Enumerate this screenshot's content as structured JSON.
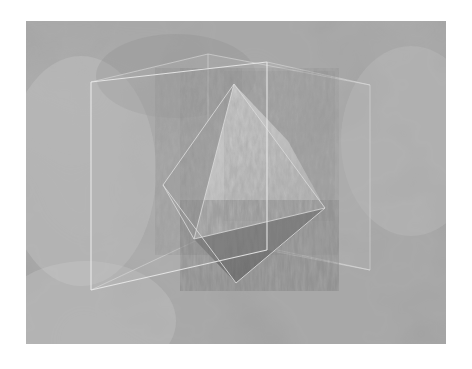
{
  "page": {
    "width": 472,
    "height": 369,
    "background_color": "#ffffff"
  },
  "figure": {
    "name": "octahedron-in-cube-render",
    "caption": "",
    "x": 26,
    "y": 21,
    "width": 420,
    "height": 323,
    "background": {
      "type": "procedural-cloud-marble",
      "base_color": "#a9a9a9",
      "light_color": "#c9c9c9",
      "dark_color": "#8b8b8b",
      "description": "soft blurred cloudy grayscale noise"
    },
    "scene": {
      "cube": {
        "name": "wireframe-cube",
        "style": "translucent faces with thin light edges",
        "edge_color": "#e8e8e8",
        "edge_opacity": 0.85,
        "face_fill": "#b4b4b4",
        "face_opacity": 0.18,
        "vertices_2d": {
          "front_top_left": [
            65,
            61
          ],
          "front_top_right": [
            241,
            41
          ],
          "front_bottom_right": [
            241,
            229
          ],
          "front_bottom_left": [
            65,
            269
          ],
          "back_top_left": [
            182,
            33
          ],
          "back_top_right": [
            344,
            64
          ],
          "back_bottom_right": [
            344,
            249
          ],
          "back_bottom_left": [
            182,
            214
          ]
        }
      },
      "octahedron": {
        "name": "octahedron-solid",
        "vertices_2d": {
          "top": [
            208,
            63
          ],
          "bottom": [
            210,
            262
          ],
          "left": [
            137,
            164
          ],
          "right": [
            299,
            187
          ],
          "front": [
            168,
            218
          ],
          "back": [
            262,
            120
          ]
        },
        "faces": [
          {
            "name": "upper-left-face",
            "shade": "#a6a6a6",
            "label": "dim upper left"
          },
          {
            "name": "upper-front-face",
            "shade": "#d3d3d3",
            "label": "bright upper front"
          },
          {
            "name": "upper-right-face",
            "shade": "#cecece",
            "label": "bright upper right"
          },
          {
            "name": "lower-front-face",
            "shade": "#6d6d6d",
            "label": "dark lower front"
          },
          {
            "name": "lower-right-face",
            "shade": "#787878",
            "label": "dark lower right"
          }
        ],
        "edge_color": "#e0e0e0",
        "texture": "fine noisy bump / wavy grain"
      }
    }
  }
}
